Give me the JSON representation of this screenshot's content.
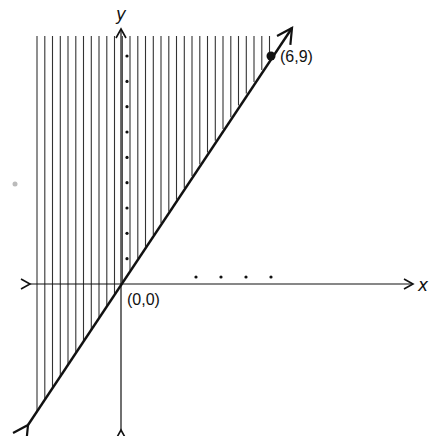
{
  "chart_data": {
    "type": "line",
    "title": "",
    "xlabel": "x",
    "ylabel": "y",
    "grid": false,
    "legend": null,
    "series": [
      {
        "name": "boundary line",
        "equation": "y = 1.5x",
        "style": "solid",
        "arrows": "both ends",
        "x": [
          0,
          6
        ],
        "y": [
          0,
          9
        ]
      }
    ],
    "shaded_region": {
      "inequality": "y >= 1.5x",
      "pattern": "vertical hatching",
      "side": "above / left of boundary line"
    },
    "points": [
      {
        "x": 0,
        "y": 0,
        "label": "(0,0)",
        "marker": "none"
      },
      {
        "x": 6,
        "y": 9,
        "label": "(6,9)",
        "marker": "filled-circle"
      }
    ],
    "y_axis_tick_dots": [
      1,
      2,
      3,
      4,
      5,
      6,
      7,
      8,
      9
    ],
    "x_axis_tick_dots": [
      3,
      4,
      5,
      6
    ],
    "xlim": [
      -3.8,
      11.7
    ],
    "ylim": [
      -5.9,
      9.9
    ]
  },
  "labels": {
    "x_axis": "x",
    "y_axis": "y",
    "origin": "(0,0)",
    "point": "(6,9)"
  },
  "colors": {
    "ink": "#111111",
    "hatch": "#333333",
    "background": "#ffffff",
    "stray_mark": "#bbbbbb"
  }
}
